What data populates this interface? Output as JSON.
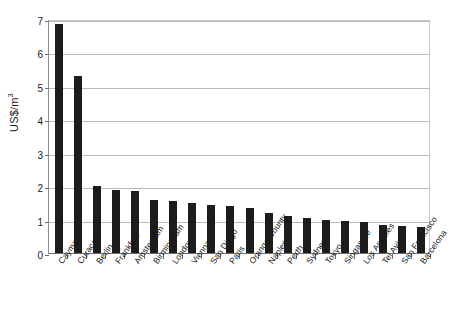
{
  "chart_data": {
    "type": "bar",
    "title": "",
    "xlabel": "",
    "ylabel": "US$/m3",
    "ylabel_display": "US$/m",
    "ylabel_exponent": "3",
    "ylim": [
      0,
      7
    ],
    "ytick_labels": [
      "0",
      "1",
      "2",
      "3",
      "4",
      "5",
      "6",
      "7"
    ],
    "ytick_values": [
      0,
      1,
      2,
      3,
      4,
      5,
      6,
      7
    ],
    "grid": true,
    "legend": "none",
    "bar_color": "#1c1c1c",
    "categories": [
      "Cayman",
      "Curacao",
      "Berlin",
      "Frankfurt",
      "Amsterdam",
      "Birmingham",
      "London",
      "Vienna",
      "San Diego",
      "Paris",
      "Orange County",
      "Naples",
      "Perth",
      "Sydney",
      "Tokyo",
      "Singapore",
      "Los Angeles",
      "Tel Aviv",
      "San Francisco",
      "Barcelona"
    ],
    "values": [
      6.85,
      5.3,
      2.0,
      1.9,
      1.87,
      1.6,
      1.55,
      1.5,
      1.45,
      1.4,
      1.35,
      1.2,
      1.1,
      1.05,
      1.0,
      0.97,
      0.93,
      0.85,
      0.82,
      0.77
    ]
  }
}
